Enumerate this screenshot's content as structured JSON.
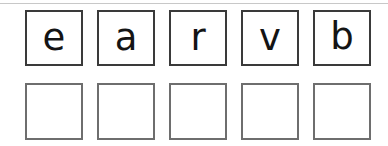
{
  "worksheet": {
    "type": "letter-tile-spelling-exercise",
    "prompt_row": {
      "name": "scrambled-letters",
      "tiles": [
        {
          "letter": "e"
        },
        {
          "letter": "a"
        },
        {
          "letter": "r"
        },
        {
          "letter": "v"
        },
        {
          "letter": "b"
        }
      ]
    },
    "answer_row": {
      "name": "answer-boxes",
      "tiles": [
        {
          "letter": ""
        },
        {
          "letter": ""
        },
        {
          "letter": ""
        },
        {
          "letter": ""
        },
        {
          "letter": ""
        }
      ]
    },
    "colors": {
      "page_background": "#ffffff",
      "prompt_border": "#3a3a3a",
      "answer_border": "#6e6e6e",
      "letter_ink": "#141414",
      "scan_line": "#c8c8c8"
    }
  }
}
